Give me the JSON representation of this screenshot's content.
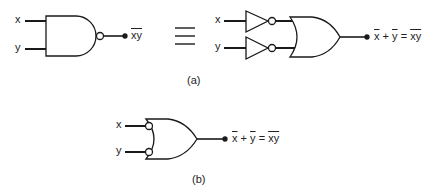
{
  "diagram": {
    "part_a": {
      "caption": "(a)",
      "nand_gate": {
        "inputs": [
          "x",
          "y"
        ],
        "output": {
          "text": "xy",
          "overline": true
        }
      },
      "equivalence_symbol": "≡",
      "inverter_or_circuit": {
        "inputs": [
          "x",
          "y"
        ],
        "output": {
          "lhs_x": "x",
          "plus": "+",
          "lhs_y": "y",
          "equals": "=",
          "rhs": "xy"
        }
      }
    },
    "part_b": {
      "caption": "(b)",
      "bubbled_or_gate": {
        "inputs": [
          "x",
          "y"
        ],
        "output": {
          "lhs_x": "x",
          "plus": "+",
          "lhs_y": "y",
          "equals": "=",
          "rhs": "xy"
        }
      }
    },
    "colors": {
      "stroke": "#1a1a1a",
      "background": "#ffffff"
    }
  }
}
